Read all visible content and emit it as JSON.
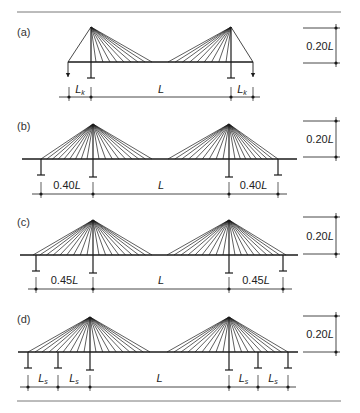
{
  "figure": {
    "top_caption_clipped": "",
    "rule_color": "#555555",
    "line_color": "#1a1a1a",
    "panels": [
      {
        "id": "a",
        "label": "(a)",
        "height_label": "0.20L",
        "spans": [
          {
            "text": "L",
            "sub": "k"
          },
          {
            "text": "L",
            "sub": ""
          },
          {
            "text": "L",
            "sub": "k"
          }
        ],
        "description": "Two-tower cable-stayed bridge with short anchored back spans (anchor piers with downward arrows)"
      },
      {
        "id": "b",
        "label": "(b)",
        "height_label": "0.20L",
        "spans": [
          {
            "text": "0.40L",
            "sub": ""
          },
          {
            "text": "L",
            "sub": ""
          },
          {
            "text": "0.40L",
            "sub": ""
          }
        ],
        "description": "Two-tower fan cable-stayed bridge, side spans 0.40L, end piers"
      },
      {
        "id": "c",
        "label": "(c)",
        "height_label": "0.20L",
        "spans": [
          {
            "text": "0.45L",
            "sub": ""
          },
          {
            "text": "L",
            "sub": ""
          },
          {
            "text": "0.45L",
            "sub": ""
          }
        ],
        "description": "Two-tower fan cable-stayed bridge, side spans 0.45L, end piers"
      },
      {
        "id": "d",
        "label": "(d)",
        "height_label": "0.20L",
        "spans": [
          {
            "text": "L",
            "sub": "s"
          },
          {
            "text": "L",
            "sub": "s"
          },
          {
            "text": "L",
            "sub": ""
          },
          {
            "text": "L",
            "sub": "s"
          },
          {
            "text": "L",
            "sub": "s"
          }
        ],
        "description": "Two-tower fan cable-stayed bridge with intermediate piers in side spans"
      }
    ]
  }
}
